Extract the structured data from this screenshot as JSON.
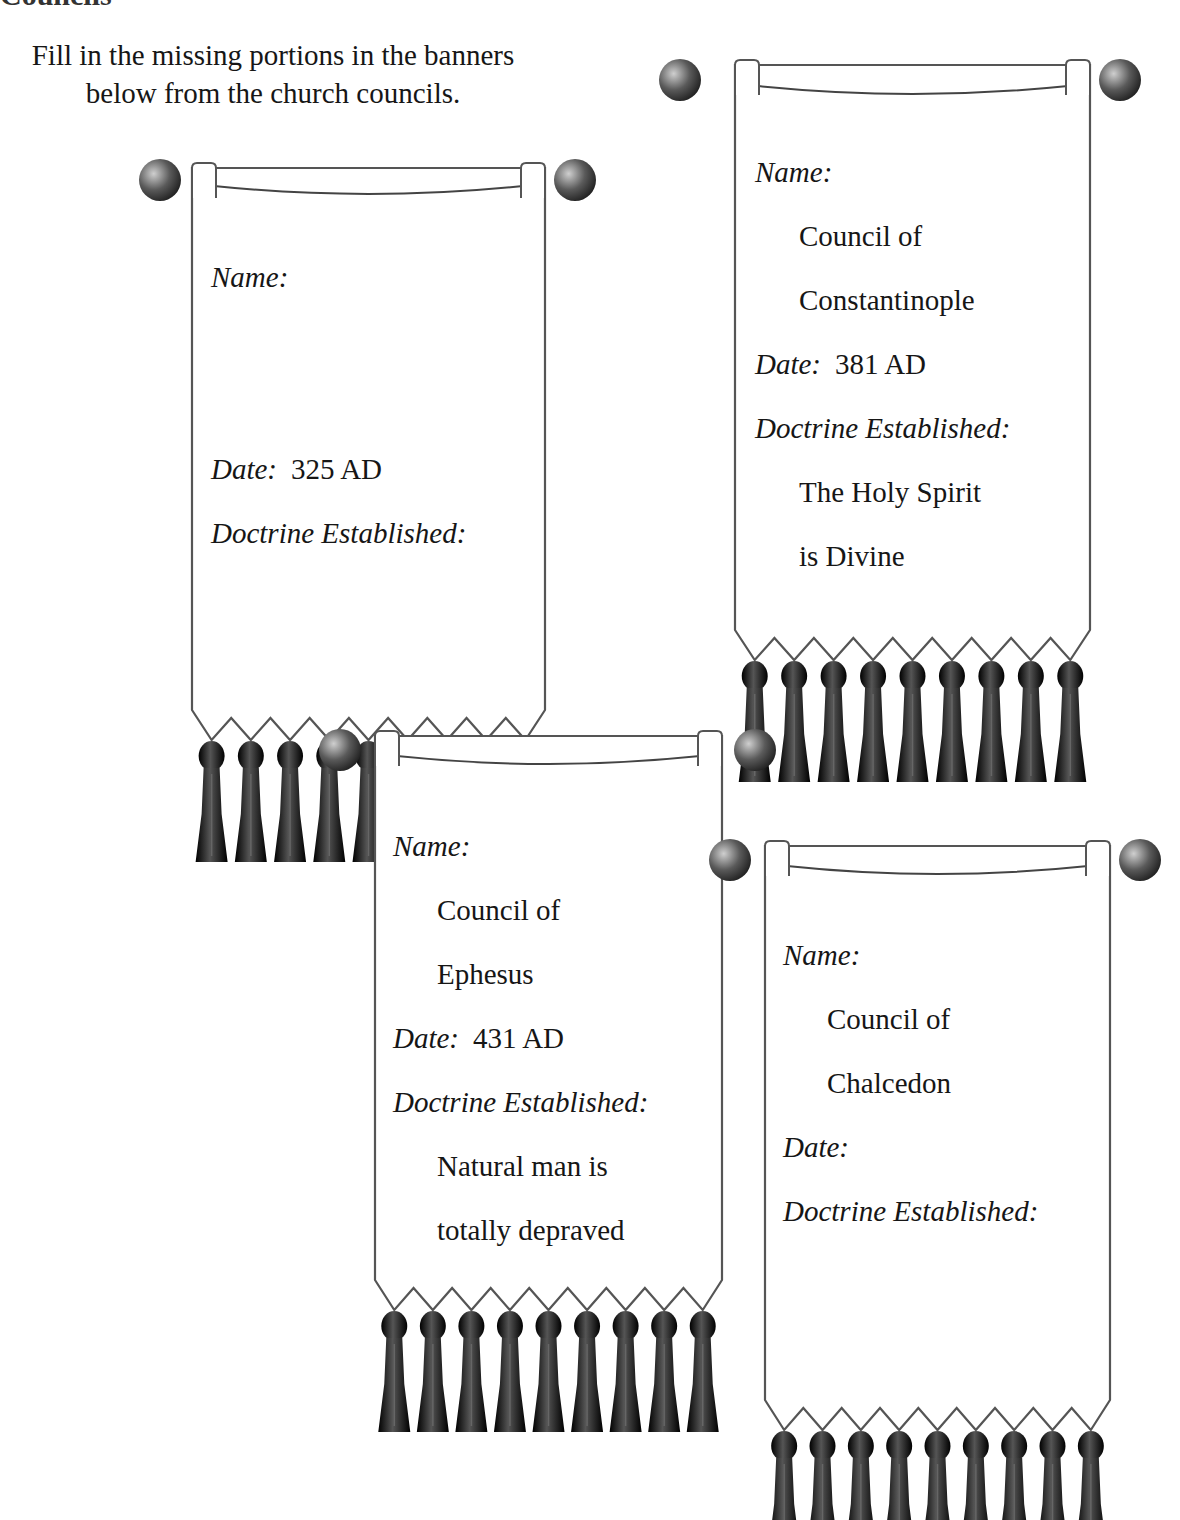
{
  "page": {
    "cut_heading": "Councils",
    "instructions": "Fill in the missing portions in the banners below from the church councils."
  },
  "labels": {
    "name": "Name:",
    "date": "Date:",
    "doctrine": "Doctrine Established:"
  },
  "banners": [
    {
      "name_lines": [
        "",
        ""
      ],
      "date": "325 AD",
      "doctrine_lines": [
        "",
        ""
      ],
      "tassel_count": 9
    },
    {
      "name_lines": [
        "Council of",
        "Constantinople"
      ],
      "date": "381 AD",
      "doctrine_lines": [
        "The Holy Spirit",
        "is Divine"
      ],
      "tassel_count": 9
    },
    {
      "name_lines": [
        "Council of",
        "Ephesus"
      ],
      "date": "431 AD",
      "doctrine_lines": [
        "Natural man is",
        "totally depraved"
      ],
      "tassel_count": 9
    },
    {
      "name_lines": [
        "Council of",
        "Chalcedon"
      ],
      "date": "",
      "doctrine_lines": [
        "",
        ""
      ],
      "tassel_count": 9
    }
  ],
  "colors": {
    "ink": "#161616",
    "rod": "#6b6b6b",
    "tassel": "#111111",
    "cloth": "#ffffff",
    "cloth_border": "#555555"
  }
}
